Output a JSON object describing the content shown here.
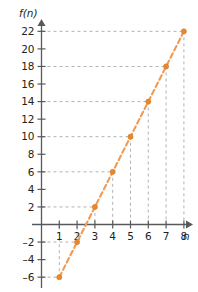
{
  "chart_data": {
    "type": "line",
    "title": "",
    "subtitle": "",
    "xlabel": "n",
    "ylabel": "f(n)",
    "x": [
      1,
      2,
      3,
      4,
      5,
      6,
      7,
      8
    ],
    "values": [
      -6,
      -2,
      2,
      6,
      10,
      14,
      18,
      22
    ],
    "series": [
      {
        "name": "f(n)",
        "values": [
          -6,
          -2,
          2,
          6,
          10,
          14,
          18,
          22
        ],
        "color": "#e8872e",
        "line_style": "dashed",
        "marker": "circle"
      }
    ],
    "xlim": [
      0,
      9
    ],
    "ylim": [
      -7,
      23
    ],
    "xticks": [
      1,
      2,
      3,
      4,
      5,
      6,
      7,
      8
    ],
    "xtick_labels": [
      "1",
      "2",
      "3",
      "4",
      "5",
      "6",
      "7",
      "8"
    ],
    "yticks": [
      -6,
      -4,
      -2,
      2,
      4,
      6,
      8,
      10,
      12,
      14,
      16,
      18,
      20,
      22
    ],
    "ytick_labels": [
      "-6",
      "-4",
      "-2",
      "2",
      "4",
      "6",
      "8",
      "10",
      "12",
      "14",
      "16",
      "18",
      "20",
      "22"
    ],
    "grid": true,
    "grid_style": "dashed",
    "grid_color": "#a7a9ac",
    "legend": false,
    "legend_position": "none",
    "annotations": [],
    "axis_color": "#58595b",
    "background_color": "#ffffff"
  },
  "axes": {
    "y_axis_label": "f(n)",
    "x_axis_label": "n"
  },
  "ticks": {
    "y": [
      "22",
      "20",
      "18",
      "16",
      "14",
      "12",
      "10",
      "8",
      "6",
      "4",
      "2",
      "-2",
      "-4",
      "-6"
    ],
    "x": [
      "1",
      "2",
      "3",
      "4",
      "5",
      "6",
      "7",
      "8"
    ]
  }
}
